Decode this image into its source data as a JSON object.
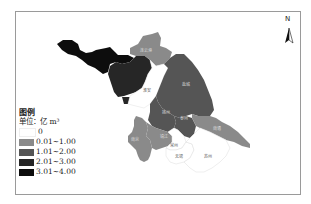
{
  "map": {
    "region": "Jiangsu",
    "north_label": "N",
    "cities": [
      {
        "name": "徐州",
        "class": "3.01~4.00",
        "color": "#0d0d0d",
        "label": ""
      },
      {
        "name": "宿迁",
        "class": "2.01~3.00",
        "color": "#262626",
        "label": ""
      },
      {
        "name": "连云港",
        "class": "0.01~1.00",
        "color": "#8a8a8a",
        "label": "连云港"
      },
      {
        "name": "淮安",
        "class": "0",
        "color": "#ffffff",
        "label": "淮安"
      },
      {
        "name": "盐城",
        "class": "1.01~2.00",
        "color": "#555555",
        "label": "盐城"
      },
      {
        "name": "扬州",
        "class": "1.01~2.00",
        "color": "#555555",
        "label": "扬州"
      },
      {
        "name": "泰州",
        "class": "1.01~2.00",
        "color": "#555555",
        "label": "泰州"
      },
      {
        "name": "南通",
        "class": "0.01~1.00",
        "color": "#8a8a8a",
        "label": "南通"
      },
      {
        "name": "南京",
        "class": "0.01~1.00",
        "color": "#8a8a8a",
        "label": "南京"
      },
      {
        "name": "镇江",
        "class": "0.01~1.00",
        "color": "#8a8a8a",
        "label": "镇江"
      },
      {
        "name": "常州",
        "class": "0",
        "color": "#ffffff",
        "label": "常州"
      },
      {
        "name": "无锡",
        "class": "0",
        "color": "#ffffff",
        "label": "无锡"
      },
      {
        "name": "苏州",
        "class": "0",
        "color": "#ffffff",
        "label": "苏州"
      }
    ]
  },
  "legend": {
    "title": "图例",
    "unit": "单位：亿 m³",
    "items": [
      {
        "label": "0",
        "color": "#ffffff"
      },
      {
        "label": "0.01~1.00",
        "color": "#8a8a8a"
      },
      {
        "label": "1.01~2.00",
        "color": "#555555"
      },
      {
        "label": "2.01~3.00",
        "color": "#262626"
      },
      {
        "label": "3.01~4.00",
        "color": "#0d0d0d"
      }
    ]
  }
}
